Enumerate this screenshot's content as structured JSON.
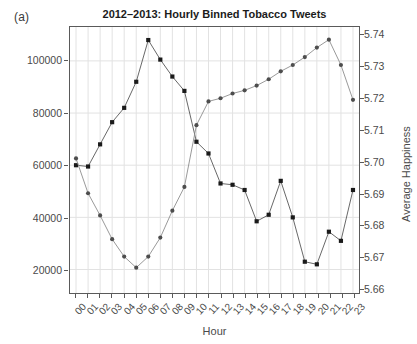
{
  "panel": {
    "label": "(a)"
  },
  "chart_data": {
    "type": "line",
    "title": "2012–2013: Hourly Binned Tobacco Tweets",
    "xlabel": "Hour",
    "ylabel": "Total Hourly Frequency",
    "y2label": "Average Happiness",
    "categories": [
      "00",
      "01",
      "02",
      "03",
      "04",
      "05",
      "06",
      "07",
      "08",
      "09",
      "10",
      "11",
      "12",
      "13",
      "14",
      "15",
      "16",
      "17",
      "18",
      "19",
      "20",
      "21",
      "22",
      "23"
    ],
    "ylim": [
      11000,
      113000
    ],
    "y2lim": [
      5.6585,
      5.7425
    ],
    "yticks": [
      20000,
      40000,
      60000,
      80000,
      100000
    ],
    "ytick_labels": [
      "20000",
      "40000",
      "60000",
      "80000",
      "100000"
    ],
    "y2ticks": [
      5.66,
      5.67,
      5.68,
      5.69,
      5.7,
      5.71,
      5.72,
      5.73,
      5.74
    ],
    "y2tick_labels": [
      "5.66",
      "5.67",
      "5.68",
      "5.69",
      "5.70",
      "5.71",
      "5.72",
      "5.73",
      "5.74"
    ],
    "grid": true,
    "legend_position": "none",
    "series": [
      {
        "name": "Total Hourly Frequency",
        "axis": "left",
        "marker": "filled-square",
        "color": "#1a1a1a",
        "values": [
          60000,
          59500,
          68000,
          76500,
          82000,
          92000,
          108000,
          100500,
          94000,
          88500,
          69000,
          64500,
          53000,
          52500,
          50500,
          38500,
          41000,
          54000,
          40000,
          23000,
          22000,
          34500,
          31000,
          50500
        ]
      },
      {
        "name": "Average Happiness",
        "axis": "right",
        "marker": "filled-circle",
        "color": "#4d4d4d",
        "values": [
          5.701,
          5.69,
          5.683,
          5.6755,
          5.67,
          5.6665,
          5.67,
          5.676,
          5.6845,
          5.692,
          5.7115,
          5.719,
          5.72,
          5.7215,
          5.7225,
          5.724,
          5.726,
          5.7285,
          5.7305,
          5.733,
          5.736,
          5.7385,
          5.7305,
          5.7195
        ]
      }
    ]
  }
}
